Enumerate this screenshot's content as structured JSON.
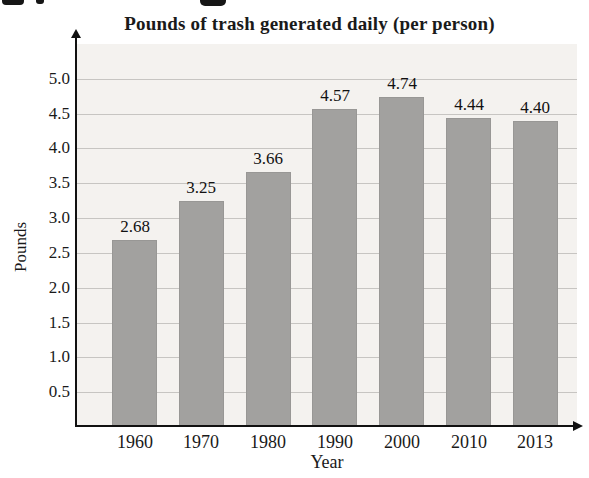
{
  "chart_data": {
    "type": "bar",
    "title": "Pounds of trash generated daily (per person)",
    "xlabel": "Year",
    "ylabel": "Pounds",
    "categories": [
      "1960",
      "1970",
      "1980",
      "1990",
      "2000",
      "2010",
      "2013"
    ],
    "values": [
      2.68,
      3.25,
      3.66,
      4.57,
      4.74,
      4.44,
      4.4
    ],
    "value_labels": [
      "2.68",
      "3.25",
      "3.66",
      "4.57",
      "4.74",
      "4.44",
      "4.40"
    ],
    "ytick_labels": [
      "0.5",
      "1.0",
      "1.5",
      "2.0",
      "2.5",
      "3.0",
      "3.5",
      "4.0",
      "4.5",
      "5.0"
    ],
    "ylim": [
      0,
      5.5
    ],
    "grid": true,
    "legend": "none",
    "colors": {
      "bar_fill": "#a2a19f",
      "plot_background": "#f4f2ef",
      "gridline": "#c7c5c2",
      "axis": "#111111",
      "text": "#1a1a1a"
    }
  }
}
